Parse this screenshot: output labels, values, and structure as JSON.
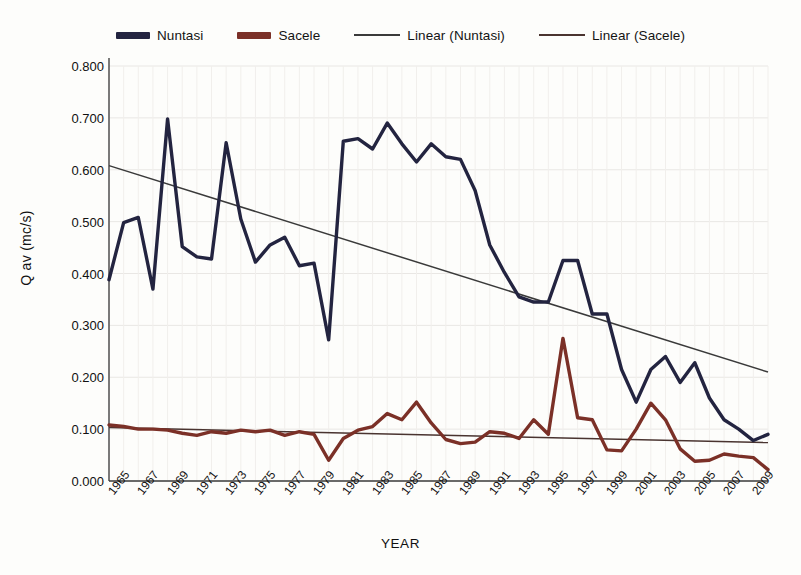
{
  "chart_data": {
    "type": "line",
    "title": "",
    "xlabel": "YEAR",
    "ylabel": "Q av (mc/s)",
    "xlim": [
      1965,
      2010
    ],
    "ylim": [
      0.0,
      0.8
    ],
    "ytick_step": 0.1,
    "ytick_labels": [
      "0.000",
      "0.100",
      "0.200",
      "0.300",
      "0.400",
      "0.500",
      "0.600",
      "0.700",
      "0.800"
    ],
    "ytick_values": [
      0.0,
      0.1,
      0.2,
      0.3,
      0.4,
      0.5,
      0.6,
      0.7,
      0.8
    ],
    "xtick_labels": [
      "1965",
      "1967",
      "1969",
      "1971",
      "1973",
      "1975",
      "1977",
      "1979",
      "1981",
      "1983",
      "1985",
      "1987",
      "1989",
      "1991",
      "1993",
      "1995",
      "1997",
      "1999",
      "2001",
      "2003",
      "2005",
      "2007",
      "2009"
    ],
    "xtick_values": [
      1965,
      1967,
      1969,
      1971,
      1973,
      1975,
      1977,
      1979,
      1981,
      1983,
      1985,
      1987,
      1989,
      1991,
      1993,
      1995,
      1997,
      1999,
      2001,
      2003,
      2005,
      2007,
      2009
    ],
    "grid": true,
    "legend_position": "top-center",
    "x": [
      1965,
      1966,
      1967,
      1968,
      1969,
      1970,
      1971,
      1972,
      1973,
      1974,
      1975,
      1976,
      1977,
      1978,
      1979,
      1980,
      1981,
      1982,
      1983,
      1984,
      1985,
      1986,
      1987,
      1988,
      1989,
      1990,
      1991,
      1992,
      1993,
      1994,
      1995,
      1996,
      1997,
      1998,
      1999,
      2000,
      2001,
      2002,
      2003,
      2004,
      2005,
      2006,
      2007,
      2008,
      2009,
      2010
    ],
    "series": [
      {
        "name": "Nuntasi",
        "color": "#232440",
        "values": [
          0.388,
          0.498,
          0.508,
          0.37,
          0.698,
          0.452,
          0.432,
          0.428,
          0.652,
          0.505,
          0.422,
          0.455,
          0.47,
          0.415,
          0.42,
          0.272,
          0.655,
          0.66,
          0.64,
          0.69,
          0.65,
          0.615,
          0.65,
          0.625,
          0.62,
          0.56,
          0.455,
          0.402,
          0.355,
          0.345,
          0.345,
          0.425,
          0.425,
          0.322,
          0.322,
          0.215,
          0.152,
          0.215,
          0.24,
          0.19,
          0.228,
          0.16,
          0.118,
          0.1,
          0.078,
          0.09
        ]
      },
      {
        "name": "Sacele",
        "color": "#7b3027",
        "values": [
          0.108,
          0.105,
          0.1,
          0.1,
          0.098,
          0.092,
          0.088,
          0.095,
          0.092,
          0.098,
          0.095,
          0.098,
          0.088,
          0.095,
          0.09,
          0.04,
          0.082,
          0.098,
          0.105,
          0.13,
          0.118,
          0.152,
          0.112,
          0.08,
          0.072,
          0.075,
          0.095,
          0.092,
          0.082,
          0.118,
          0.09,
          0.275,
          0.122,
          0.118,
          0.06,
          0.058,
          0.1,
          0.15,
          0.118,
          0.062,
          0.038,
          0.04,
          0.052,
          0.048,
          0.045,
          0.022
        ]
      }
    ],
    "trendlines": [
      {
        "name": "Linear (Nuntasi)",
        "color": "#3a3a3a",
        "x0": 1965,
        "y0": 0.608,
        "x1": 2010,
        "y1": 0.21
      },
      {
        "name": "Linear (Sacele)",
        "color": "#4a3430",
        "x0": 1965,
        "y0": 0.103,
        "x1": 2010,
        "y1": 0.074
      }
    ]
  },
  "legend": {
    "items": [
      {
        "label": "Nuntasi",
        "color": "#232440",
        "style": "thick"
      },
      {
        "label": "Sacele",
        "color": "#7b3027",
        "style": "thick"
      },
      {
        "label": "Linear (Nuntasi)",
        "color": "#3a3a3a",
        "style": "thin"
      },
      {
        "label": "Linear (Sacele)",
        "color": "#4a3430",
        "style": "thin"
      }
    ]
  },
  "axes": {
    "y_title": "Q av (mc/s)",
    "x_title": "YEAR"
  }
}
